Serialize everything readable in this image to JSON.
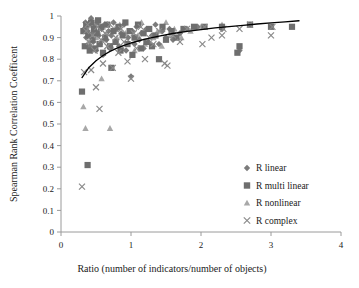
{
  "chart_data": {
    "type": "scatter",
    "title": "",
    "xlabel": "Ratio (number of indicators/number of objects)",
    "ylabel": "Spearman Rank Correlation Coefficent",
    "xlim": [
      0,
      4
    ],
    "ylim": [
      0,
      1
    ],
    "xticks": [
      "0",
      "1",
      "2",
      "3",
      "4"
    ],
    "xtick_values": [
      0,
      1,
      2,
      3,
      4
    ],
    "yticks": [
      "0",
      "0.1",
      "0.2",
      "0.3",
      "0.4",
      "0.5",
      "0.6",
      "0.7",
      "0.8",
      "0.9",
      "1"
    ],
    "ytick_values": [
      0,
      0.1,
      0.2,
      0.3,
      0.4,
      0.5,
      0.6,
      0.7,
      0.8,
      0.9,
      1
    ],
    "grid": false,
    "legend_position": "center-right",
    "colors": {
      "r_linear": "#7b7b7b",
      "r_multi_linear": "#6e6e6e",
      "r_nonlinear": "#a8a8a8",
      "r_complex": "#8a8a8a",
      "trendline": "#000000",
      "axis": "#9a9a9a",
      "background": "#ffffff"
    },
    "series": [
      {
        "name": "R linear",
        "marker": "diamond",
        "color": "#7b7b7b",
        "points": [
          [
            0.33,
            0.94
          ],
          [
            0.35,
            0.97
          ],
          [
            0.36,
            0.9
          ],
          [
            0.38,
            0.93
          ],
          [
            0.4,
            0.96
          ],
          [
            0.41,
            0.86
          ],
          [
            0.43,
            0.99
          ],
          [
            0.45,
            0.92
          ],
          [
            0.46,
            0.88
          ],
          [
            0.48,
            0.95
          ],
          [
            0.5,
            0.84
          ],
          [
            0.52,
            0.97
          ],
          [
            0.54,
            0.91
          ],
          [
            0.56,
            0.87
          ],
          [
            0.58,
            0.94
          ],
          [
            0.6,
            0.82
          ],
          [
            0.62,
            0.96
          ],
          [
            0.65,
            0.89
          ],
          [
            0.68,
            0.93
          ],
          [
            0.7,
            0.85
          ],
          [
            0.72,
            0.91
          ],
          [
            0.75,
            0.97
          ],
          [
            0.78,
            0.88
          ],
          [
            0.8,
            0.94
          ],
          [
            0.83,
            0.86
          ],
          [
            0.86,
            0.92
          ],
          [
            0.9,
            0.96
          ],
          [
            0.93,
            0.84
          ],
          [
            0.96,
            0.9
          ],
          [
            1.0,
            0.72
          ],
          [
            1.02,
            0.93
          ],
          [
            1.05,
            0.87
          ],
          [
            1.08,
            0.95
          ],
          [
            1.12,
            0.89
          ],
          [
            1.15,
            0.92
          ],
          [
            1.18,
            0.85
          ],
          [
            1.22,
            0.94
          ],
          [
            1.25,
            0.88
          ],
          [
            1.3,
            0.91
          ],
          [
            1.35,
            0.96
          ],
          [
            1.4,
            0.87
          ],
          [
            1.45,
            0.93
          ],
          [
            1.5,
            0.9
          ],
          [
            1.55,
            0.94
          ],
          [
            1.6,
            0.89
          ],
          [
            1.7,
            0.92
          ],
          [
            1.8,
            0.94
          ],
          [
            1.95,
            0.95
          ],
          [
            2.3,
            0.94
          ],
          [
            2.55,
            0.84
          ]
        ]
      },
      {
        "name": "R multi linear",
        "marker": "square",
        "color": "#6e6e6e",
        "points": [
          [
            0.3,
            0.65
          ],
          [
            0.32,
            0.93
          ],
          [
            0.34,
            0.86
          ],
          [
            0.36,
            0.96
          ],
          [
            0.38,
            0.31
          ],
          [
            0.39,
            0.91
          ],
          [
            0.41,
            0.84
          ],
          [
            0.43,
            0.97
          ],
          [
            0.45,
            0.89
          ],
          [
            0.47,
            0.94
          ],
          [
            0.49,
            0.85
          ],
          [
            0.51,
            0.92
          ],
          [
            0.53,
            0.98
          ],
          [
            0.55,
            0.87
          ],
          [
            0.57,
            0.95
          ],
          [
            0.6,
            0.83
          ],
          [
            0.63,
            0.9
          ],
          [
            0.66,
            0.96
          ],
          [
            0.7,
            0.86
          ],
          [
            0.72,
            0.76
          ],
          [
            0.75,
            0.93
          ],
          [
            0.78,
            0.88
          ],
          [
            0.82,
            0.95
          ],
          [
            0.85,
            0.84
          ],
          [
            0.88,
            0.91
          ],
          [
            0.92,
            0.97
          ],
          [
            0.95,
            0.87
          ],
          [
            0.98,
            0.93
          ],
          [
            1.02,
            0.82
          ],
          [
            1.05,
            0.9
          ],
          [
            1.1,
            0.96
          ],
          [
            1.14,
            0.85
          ],
          [
            1.18,
            0.92
          ],
          [
            1.22,
            0.88
          ],
          [
            1.26,
            0.94
          ],
          [
            1.3,
            0.86
          ],
          [
            1.35,
            0.91
          ],
          [
            1.4,
            0.8
          ],
          [
            1.45,
            0.95
          ],
          [
            1.5,
            0.89
          ],
          [
            1.58,
            0.93
          ],
          [
            1.65,
            0.9
          ],
          [
            1.75,
            0.94
          ],
          [
            1.9,
            0.95
          ],
          [
            2.05,
            0.95
          ],
          [
            2.3,
            0.95
          ],
          [
            2.52,
            0.83
          ],
          [
            2.55,
            0.86
          ],
          [
            2.7,
            0.96
          ],
          [
            3.0,
            0.95
          ],
          [
            3.3,
            0.95
          ]
        ]
      },
      {
        "name": "R nonlinear",
        "marker": "triangle",
        "color": "#a8a8a8",
        "points": [
          [
            0.32,
            0.58
          ],
          [
            0.35,
            0.48
          ],
          [
            0.37,
            0.94
          ],
          [
            0.39,
            0.88
          ],
          [
            0.42,
            0.96
          ],
          [
            0.44,
            0.91
          ],
          [
            0.46,
            0.85
          ],
          [
            0.48,
            0.97
          ],
          [
            0.5,
            0.9
          ],
          [
            0.53,
            0.93
          ],
          [
            0.56,
            0.87
          ],
          [
            0.58,
            0.71
          ],
          [
            0.6,
            0.95
          ],
          [
            0.63,
            0.89
          ],
          [
            0.66,
            0.92
          ],
          [
            0.7,
            0.48
          ],
          [
            0.72,
            0.86
          ],
          [
            0.76,
            0.94
          ],
          [
            0.8,
            0.9
          ],
          [
            0.84,
            0.96
          ],
          [
            0.88,
            0.85
          ],
          [
            0.92,
            0.92
          ],
          [
            0.96,
            0.88
          ],
          [
            1.0,
            0.93
          ],
          [
            1.05,
            0.84
          ],
          [
            1.1,
            0.91
          ],
          [
            1.15,
            0.97
          ],
          [
            1.2,
            0.87
          ],
          [
            1.25,
            0.94
          ],
          [
            1.32,
            0.9
          ],
          [
            1.38,
            0.93
          ],
          [
            1.44,
            0.86
          ],
          [
            1.5,
            0.97
          ],
          [
            1.56,
            0.91
          ],
          [
            1.62,
            0.94
          ],
          [
            1.72,
            0.9
          ],
          [
            1.85,
            0.93
          ],
          [
            2.0,
            0.95
          ],
          [
            2.3,
            0.96
          ],
          [
            2.7,
            0.96
          ]
        ]
      },
      {
        "name": "R complex",
        "marker": "cross",
        "color": "#8a8a8a",
        "points": [
          [
            0.3,
            0.21
          ],
          [
            0.33,
            0.74
          ],
          [
            0.36,
            0.93
          ],
          [
            0.38,
            0.96
          ],
          [
            0.4,
            0.88
          ],
          [
            0.43,
            0.75
          ],
          [
            0.45,
            0.91
          ],
          [
            0.48,
            0.84
          ],
          [
            0.5,
            0.67
          ],
          [
            0.52,
            0.95
          ],
          [
            0.55,
            0.57
          ],
          [
            0.57,
            0.89
          ],
          [
            0.6,
            0.78
          ],
          [
            0.63,
            0.92
          ],
          [
            0.66,
            0.86
          ],
          [
            0.7,
            0.96
          ],
          [
            0.74,
            0.76
          ],
          [
            0.78,
            0.9
          ],
          [
            0.82,
            0.83
          ],
          [
            0.86,
            0.94
          ],
          [
            0.9,
            0.88
          ],
          [
            0.95,
            0.79
          ],
          [
            1.0,
            0.71
          ],
          [
            1.04,
            0.92
          ],
          [
            1.08,
            0.85
          ],
          [
            1.14,
            0.95
          ],
          [
            1.2,
            0.8
          ],
          [
            1.26,
            0.9
          ],
          [
            1.32,
            0.87
          ],
          [
            1.4,
            0.93
          ],
          [
            1.48,
            0.78
          ],
          [
            1.52,
            0.77
          ],
          [
            1.6,
            0.91
          ],
          [
            1.7,
            0.88
          ],
          [
            1.8,
            0.94
          ],
          [
            2.02,
            0.87
          ],
          [
            2.05,
            0.95
          ],
          [
            2.15,
            0.9
          ],
          [
            2.3,
            0.91
          ],
          [
            2.32,
            0.94
          ],
          [
            2.55,
            0.94
          ],
          [
            2.7,
            0.96
          ],
          [
            3.0,
            0.91
          ],
          [
            3.02,
            0.95
          ]
        ]
      }
    ],
    "trendline": {
      "label": "logarithmic fit",
      "points": [
        [
          0.3,
          0.715
        ],
        [
          0.4,
          0.762
        ],
        [
          0.5,
          0.793
        ],
        [
          0.6,
          0.817
        ],
        [
          0.7,
          0.836
        ],
        [
          0.8,
          0.851
        ],
        [
          0.9,
          0.864
        ],
        [
          1.0,
          0.875
        ],
        [
          1.2,
          0.893
        ],
        [
          1.4,
          0.907
        ],
        [
          1.6,
          0.919
        ],
        [
          1.8,
          0.929
        ],
        [
          2.0,
          0.937
        ],
        [
          2.2,
          0.945
        ],
        [
          2.4,
          0.951
        ],
        [
          2.6,
          0.957
        ],
        [
          2.8,
          0.963
        ],
        [
          3.0,
          0.968
        ],
        [
          3.2,
          0.973
        ],
        [
          3.4,
          0.978
        ]
      ]
    }
  },
  "legend": {
    "items": [
      {
        "label": "R linear",
        "marker": "diamond"
      },
      {
        "label": "R multi linear",
        "marker": "square"
      },
      {
        "label": "R nonlinear",
        "marker": "triangle"
      },
      {
        "label": "R complex",
        "marker": "cross"
      }
    ]
  }
}
